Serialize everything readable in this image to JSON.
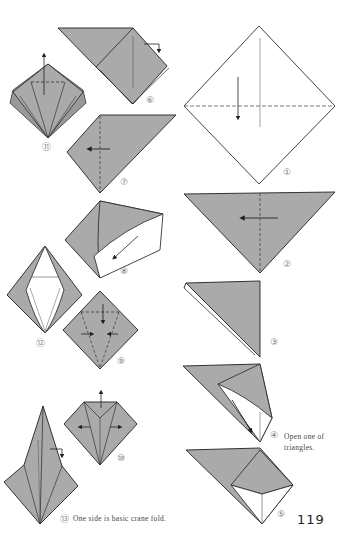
{
  "page": {
    "page_number": "119",
    "paper_color": "#aaaaaa",
    "line_color": "#333333"
  },
  "steps": [
    {
      "id": 1,
      "label": "①",
      "caption": ""
    },
    {
      "id": 2,
      "label": "②",
      "caption": ""
    },
    {
      "id": 3,
      "label": "③",
      "caption": ""
    },
    {
      "id": 4,
      "label": "④",
      "caption_line1": "Open one of",
      "caption_line2": "triangles."
    },
    {
      "id": 5,
      "label": "⑤",
      "caption": ""
    },
    {
      "id": 6,
      "label": "⑥",
      "caption": ""
    },
    {
      "id": 7,
      "label": "⑦",
      "caption": ""
    },
    {
      "id": 8,
      "label": "⑧",
      "caption": ""
    },
    {
      "id": 9,
      "label": "⑨",
      "caption": ""
    },
    {
      "id": 10,
      "label": "⑩",
      "caption": ""
    },
    {
      "id": 11,
      "label": "⑪",
      "caption": ""
    },
    {
      "id": 12,
      "label": "⑫",
      "caption": ""
    },
    {
      "id": 13,
      "label": "⑬",
      "caption": "One side is basic crane fold."
    }
  ]
}
